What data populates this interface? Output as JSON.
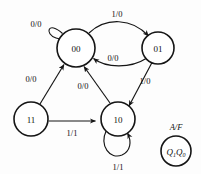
{
  "diagram": {
    "background_color": "#fdfdfd",
    "line_color": "#151515",
    "text_color": "#111111"
  },
  "states": [
    {
      "id": "s00",
      "label": "00",
      "cx": 76,
      "cy": 48,
      "r": 19
    },
    {
      "id": "s01",
      "label": "01",
      "cx": 158,
      "cy": 48,
      "r": 16
    },
    {
      "id": "s11",
      "label": "11",
      "cx": 31,
      "cy": 119,
      "r": 17
    },
    {
      "id": "s10",
      "label": "10",
      "cx": 118,
      "cy": 119,
      "r": 17
    }
  ],
  "transitions": [
    {
      "id": "t-00-00",
      "from": "00",
      "to": "00",
      "label": "0/0",
      "lx": 36,
      "ly": 27,
      "kind": "self-loop-upper-left"
    },
    {
      "id": "t-00-01",
      "from": "00",
      "to": "01",
      "label": "1/0",
      "lx": 117,
      "ly": 17,
      "kind": "arc-top"
    },
    {
      "id": "t-01-00",
      "from": "01",
      "to": "00",
      "label": "0/0",
      "lx": 113,
      "ly": 61,
      "kind": "arc-return"
    },
    {
      "id": "t-01-10",
      "from": "01",
      "to": "10",
      "label": "1/0",
      "lx": 144,
      "ly": 83,
      "kind": "straight"
    },
    {
      "id": "t-11-00",
      "from": "11",
      "to": "00",
      "label": "0/0",
      "lx": 32,
      "ly": 82,
      "kind": "straight"
    },
    {
      "id": "t-10-00",
      "from": "10",
      "to": "00",
      "label": "0/0",
      "lx": 83,
      "ly": 88,
      "kind": "straight"
    },
    {
      "id": "t-11-10",
      "from": "11",
      "to": "10",
      "label": "1/1",
      "lx": 72,
      "ly": 136,
      "kind": "straight-horizontal"
    },
    {
      "id": "t-10-10",
      "from": "10",
      "to": "10",
      "label": "1/1",
      "lx": 118,
      "ly": 170,
      "kind": "self-loop-bottom"
    }
  ],
  "legend": {
    "io_label": "A/F",
    "io_label_x": 176,
    "io_label_y": 128,
    "state_name": "Q",
    "state_sub_1": "1",
    "state_name_2": "Q",
    "state_sub_2": "0",
    "cx": 176,
    "cy": 150,
    "r": 15
  }
}
